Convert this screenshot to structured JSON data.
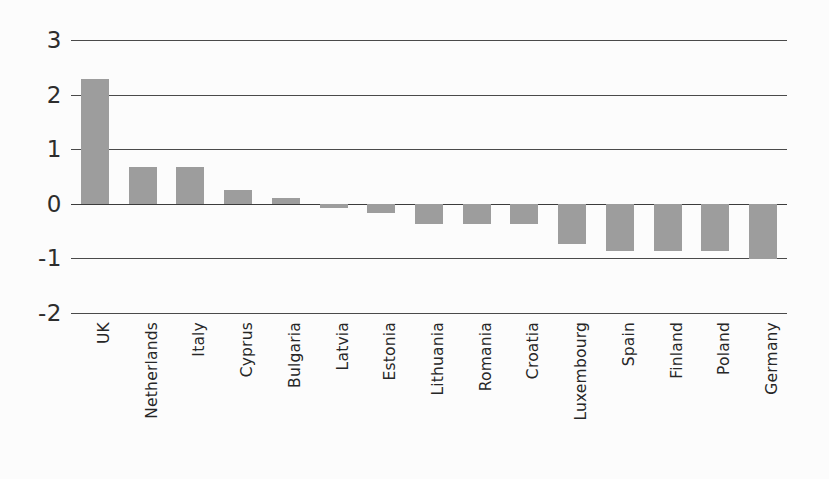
{
  "chart_data": {
    "type": "bar",
    "title": "",
    "subtitle": "",
    "xlabel": "",
    "ylabel": "",
    "categories": [
      "UK",
      "Netherlands",
      "Italy",
      "Cyprus",
      "Bulgaria",
      "Latvia",
      "Estonia",
      "Lithuania",
      "Romania",
      "Croatia",
      "Luxembourg",
      "Spain",
      "Finland",
      "Poland",
      "Germany"
    ],
    "values": [
      2.28,
      0.67,
      0.67,
      0.26,
      0.1,
      -0.07,
      -0.17,
      -0.37,
      -0.37,
      -0.37,
      -0.73,
      -0.87,
      -0.87,
      -0.87,
      -1.02
    ],
    "ylim": [
      -2,
      3
    ],
    "yticks": [
      3,
      2,
      1,
      0,
      -1,
      -2
    ],
    "ytick_labels": [
      "3",
      "2",
      "1",
      "0",
      "-1",
      "-2"
    ],
    "grid": true,
    "grid_axis": "y",
    "legend": false,
    "legend_position": "none",
    "series": [
      {
        "name": "",
        "values": [
          2.28,
          0.67,
          0.67,
          0.26,
          0.1,
          -0.07,
          -0.17,
          -0.37,
          -0.37,
          -0.37,
          -0.73,
          -0.87,
          -0.87,
          -0.87,
          -1.02
        ]
      }
    ],
    "bar_color": "#9d9d9d",
    "grid_color": "#4a4a4a",
    "text_color": "#2d2d2d",
    "background_color": "#fcfcfc"
  },
  "figure": {
    "y_tick_0": "3",
    "y_tick_1": "2",
    "y_tick_2": "1",
    "y_tick_3": "0",
    "y_tick_4": "-1",
    "y_tick_5": "-2",
    "cat_0": "UK",
    "cat_1": "Netherlands",
    "cat_2": "Italy",
    "cat_3": "Cyprus",
    "cat_4": "Bulgaria",
    "cat_5": "Latvia",
    "cat_6": "Estonia",
    "cat_7": "Lithuania",
    "cat_8": "Romania",
    "cat_9": "Croatia",
    "cat_10": "Luxembourg",
    "cat_11": "Spain",
    "cat_12": "Finland",
    "cat_13": "Poland",
    "cat_14": "Germany"
  }
}
